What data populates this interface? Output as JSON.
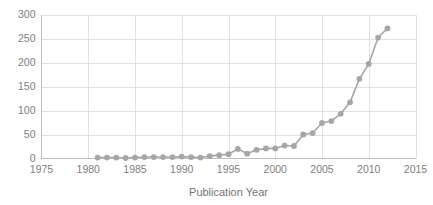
{
  "chart_data": {
    "type": "line",
    "title": "",
    "subtitle": "",
    "xlabel": "Publication Year",
    "ylabel": "",
    "xlim": [
      1975,
      2015
    ],
    "ylim": [
      0,
      300
    ],
    "xticks": [
      1975,
      1980,
      1985,
      1990,
      1995,
      2000,
      2005,
      2010,
      2015
    ],
    "xtick_labels": [
      "1975",
      "1980",
      "1985",
      "1990",
      "1995",
      "2000",
      "2005",
      "2010",
      "2015"
    ],
    "yticks": [
      0,
      50,
      100,
      150,
      200,
      250,
      300
    ],
    "ytick_labels": [
      "0",
      "50",
      "100",
      "150",
      "200",
      "250",
      "300"
    ],
    "grid": {
      "horizontal": true,
      "vertical": true
    },
    "legend": {
      "visible": false,
      "position": "none"
    },
    "marker": "circle",
    "series": [
      {
        "name": "Publications",
        "color": "#a6a6a6",
        "x": [
          1981,
          1982,
          1983,
          1984,
          1985,
          1986,
          1987,
          1988,
          1989,
          1990,
          1991,
          1992,
          1993,
          1994,
          1995,
          1996,
          1997,
          1998,
          1999,
          2000,
          2001,
          2002,
          2003,
          2004,
          2005,
          2006,
          2007,
          2008,
          2009,
          2010,
          2011,
          2012
        ],
        "values": [
          2,
          2,
          2,
          1,
          2,
          3,
          3,
          3,
          3,
          4,
          3,
          2,
          5,
          7,
          9,
          20,
          10,
          18,
          21,
          21,
          27,
          26,
          50,
          53,
          74,
          78,
          93,
          117,
          166,
          197,
          252,
          271
        ]
      }
    ],
    "colors": {
      "series": "#a6a6a6",
      "grid": "#d9d9d9",
      "axis": "#bfbfbf",
      "tick_text": "#808080",
      "axis_title": "#737373",
      "background": "#ffffff"
    }
  }
}
